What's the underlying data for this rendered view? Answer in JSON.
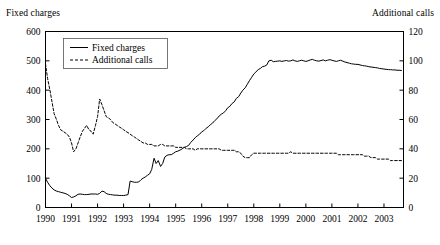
{
  "figure": {
    "left_axis_title": "Fixed charges",
    "right_axis_title": "Additional calls"
  },
  "legend": {
    "items": [
      {
        "label": "Fixed charges",
        "style": "solid"
      },
      {
        "label": "Additional calls",
        "style": "dashed"
      }
    ]
  },
  "chart_data": {
    "type": "line",
    "title": "",
    "xlabel": "",
    "ylabel": "Fixed charges",
    "y2label": "Additional calls",
    "grid": false,
    "legend_position": "top-left-inside",
    "xlim": [
      1990.0,
      2003.75
    ],
    "ylim": [
      0,
      600
    ],
    "y2lim": [
      0,
      120
    ],
    "xticks": [
      "1990",
      "1991",
      "1992",
      "1993",
      "1994",
      "1995",
      "1996",
      "1997",
      "1998",
      "1999",
      "2000",
      "2001",
      "2002",
      "2003"
    ],
    "yticks": [
      "0",
      "100",
      "200",
      "300",
      "400",
      "500",
      "600"
    ],
    "y2ticks": [
      "0",
      "20",
      "40",
      "60",
      "80",
      "100",
      "120"
    ],
    "series": [
      {
        "name": "Fixed charges",
        "axis": "left",
        "style": "solid",
        "color": "#000000",
        "x": [
          1990.0,
          1990.08,
          1990.17,
          1990.25,
          1990.33,
          1990.42,
          1990.5,
          1990.58,
          1990.67,
          1990.75,
          1990.83,
          1990.92,
          1991.0,
          1991.08,
          1991.17,
          1991.25,
          1991.33,
          1991.42,
          1991.5,
          1991.58,
          1991.67,
          1991.75,
          1991.83,
          1991.92,
          1992.0,
          1992.08,
          1992.17,
          1992.25,
          1992.33,
          1992.42,
          1992.5,
          1992.58,
          1992.67,
          1992.75,
          1992.83,
          1992.92,
          1993.0,
          1993.08,
          1993.17,
          1993.25,
          1993.33,
          1993.42,
          1993.5,
          1993.58,
          1993.67,
          1993.75,
          1993.83,
          1993.92,
          1994.0,
          1994.08,
          1994.17,
          1994.25,
          1994.33,
          1994.42,
          1994.5,
          1994.58,
          1994.67,
          1994.75,
          1994.83,
          1994.92,
          1995.0,
          1995.08,
          1995.17,
          1995.25,
          1995.33,
          1995.42,
          1995.5,
          1995.58,
          1995.67,
          1995.75,
          1995.83,
          1995.92,
          1996.0,
          1996.08,
          1996.17,
          1996.25,
          1996.33,
          1996.42,
          1996.5,
          1996.58,
          1996.67,
          1996.75,
          1996.83,
          1996.92,
          1997.0,
          1997.08,
          1997.17,
          1997.25,
          1997.33,
          1997.42,
          1997.5,
          1997.58,
          1997.67,
          1997.75,
          1997.83,
          1997.92,
          1998.0,
          1998.08,
          1998.17,
          1998.25,
          1998.33,
          1998.42,
          1998.5,
          1998.58,
          1998.67,
          1998.75,
          1998.83,
          1998.92,
          1999.0,
          1999.08,
          1999.17,
          1999.25,
          1999.33,
          1999.42,
          1999.5,
          1999.58,
          1999.67,
          1999.75,
          1999.83,
          1999.92,
          2000.0,
          2000.08,
          2000.17,
          2000.25,
          2000.33,
          2000.42,
          2000.5,
          2000.58,
          2000.67,
          2000.75,
          2000.83,
          2000.92,
          2001.0,
          2001.08,
          2001.17,
          2001.25,
          2001.33,
          2001.42,
          2001.5,
          2001.58,
          2001.67,
          2001.75,
          2001.83,
          2001.92,
          2002.0,
          2002.08,
          2002.17,
          2002.25,
          2002.33,
          2002.42,
          2002.5,
          2002.58,
          2002.67,
          2002.75,
          2002.83,
          2002.92,
          2003.0,
          2003.08,
          2003.17,
          2003.25,
          2003.33,
          2003.42,
          2003.5,
          2003.58,
          2003.67
        ],
        "values": [
          100,
          86,
          74,
          66,
          60,
          56,
          54,
          52,
          50,
          48,
          45,
          40,
          34,
          36,
          40,
          45,
          46,
          45,
          44,
          44,
          45,
          46,
          46,
          46,
          45,
          48,
          56,
          54,
          48,
          45,
          44,
          43,
          42,
          42,
          41,
          41,
          41,
          42,
          44,
          90,
          88,
          86,
          86,
          87,
          95,
          100,
          104,
          110,
          115,
          130,
          168,
          150,
          160,
          140,
          150,
          172,
          178,
          180,
          180,
          185,
          190,
          192,
          196,
          200,
          205,
          208,
          212,
          222,
          230,
          238,
          244,
          250,
          258,
          262,
          270,
          275,
          282,
          288,
          296,
          302,
          312,
          318,
          322,
          330,
          340,
          345,
          355,
          360,
          372,
          378,
          390,
          400,
          408,
          420,
          432,
          444,
          455,
          462,
          470,
          474,
          480,
          482,
          486,
          500,
          502,
          497,
          498,
          499,
          500,
          498,
          500,
          501,
          499,
          500,
          503,
          500,
          498,
          500,
          502,
          500,
          498,
          500,
          503,
          505,
          502,
          500,
          499,
          501,
          503,
          500,
          502,
          504,
          502,
          500,
          498,
          500,
          502,
          499,
          496,
          494,
          492,
          490,
          489,
          488,
          488,
          486,
          484,
          483,
          482,
          480,
          479,
          478,
          477,
          476,
          474,
          473,
          472,
          471,
          470,
          470,
          469,
          469,
          468,
          468,
          467
        ]
      },
      {
        "name": "Additional calls",
        "axis": "right",
        "style": "dashed",
        "color": "#000000",
        "x": [
          1990.0,
          1990.08,
          1990.17,
          1990.25,
          1990.33,
          1990.42,
          1990.5,
          1990.58,
          1990.67,
          1990.75,
          1990.83,
          1990.92,
          1991.0,
          1991.08,
          1991.17,
          1991.25,
          1991.33,
          1991.42,
          1991.5,
          1991.58,
          1991.67,
          1991.75,
          1991.83,
          1991.92,
          1992.0,
          1992.08,
          1992.17,
          1992.25,
          1992.33,
          1992.42,
          1992.5,
          1992.58,
          1992.67,
          1992.75,
          1992.83,
          1992.92,
          1993.0,
          1993.08,
          1993.17,
          1993.25,
          1993.33,
          1993.42,
          1993.5,
          1993.58,
          1993.67,
          1993.75,
          1993.83,
          1993.92,
          1994.0,
          1994.08,
          1994.17,
          1994.25,
          1994.33,
          1994.42,
          1994.5,
          1994.58,
          1994.67,
          1994.75,
          1994.83,
          1994.92,
          1995.0,
          1995.08,
          1995.17,
          1995.25,
          1995.33,
          1995.42,
          1995.5,
          1995.58,
          1995.67,
          1995.75,
          1995.83,
          1995.92,
          1996.0,
          1996.08,
          1996.17,
          1996.25,
          1996.33,
          1996.42,
          1996.5,
          1996.58,
          1996.67,
          1996.75,
          1996.83,
          1996.92,
          1997.0,
          1997.08,
          1997.17,
          1997.25,
          1997.33,
          1997.42,
          1997.5,
          1997.58,
          1997.67,
          1997.75,
          1997.83,
          1997.92,
          1998.0,
          1998.08,
          1998.17,
          1998.25,
          1998.33,
          1998.42,
          1998.5,
          1998.58,
          1998.67,
          1998.75,
          1998.83,
          1998.92,
          1999.0,
          1999.08,
          1999.17,
          1999.25,
          1999.33,
          1999.42,
          1999.5,
          1999.58,
          1999.67,
          1999.75,
          1999.83,
          1999.92,
          2000.0,
          2000.08,
          2000.17,
          2000.25,
          2000.33,
          2000.42,
          2000.5,
          2000.58,
          2000.67,
          2000.75,
          2000.83,
          2000.92,
          2001.0,
          2001.08,
          2001.17,
          2001.25,
          2001.33,
          2001.42,
          2001.5,
          2001.58,
          2001.67,
          2001.75,
          2001.83,
          2001.92,
          2002.0,
          2002.08,
          2002.17,
          2002.25,
          2002.33,
          2002.42,
          2002.5,
          2002.58,
          2002.67,
          2002.75,
          2002.83,
          2002.92,
          2003.0,
          2003.08,
          2003.17,
          2003.25,
          2003.33,
          2003.42,
          2003.5,
          2003.58,
          2003.67
        ],
        "values": [
          98,
          88,
          80,
          72,
          64,
          60,
          56,
          53,
          52,
          51,
          50,
          48,
          44,
          38,
          40,
          44,
          48,
          52,
          54,
          56,
          53,
          52,
          50,
          56,
          62,
          74,
          70,
          66,
          62,
          61,
          60,
          58,
          57,
          56,
          55,
          54,
          53,
          52,
          51,
          50,
          49,
          48,
          47,
          46,
          45,
          44,
          44,
          43,
          43,
          43,
          42,
          42,
          42,
          43,
          43,
          42,
          42,
          42,
          42,
          42,
          41,
          41,
          41,
          41,
          41,
          40,
          40,
          40,
          40,
          39,
          40,
          40,
          40,
          40,
          40,
          40,
          40,
          40,
          40,
          40,
          40,
          39,
          39,
          39,
          39,
          39,
          39,
          39,
          38,
          38,
          37,
          35,
          34,
          34,
          34,
          36,
          37,
          37,
          37,
          37,
          37,
          37,
          37,
          37,
          37,
          37,
          37,
          37,
          37,
          37,
          37,
          37,
          37,
          38,
          37,
          37,
          37,
          37,
          37,
          37,
          37,
          37,
          37,
          37,
          37,
          37,
          37,
          37,
          37,
          37,
          37,
          37,
          37,
          37,
          37,
          36,
          36,
          36,
          36,
          36,
          36,
          36,
          36,
          36,
          36,
          36,
          36,
          35,
          35,
          35,
          34,
          34,
          34,
          33,
          33,
          33,
          33,
          33,
          33,
          32,
          32,
          32,
          32,
          32,
          32
        ]
      }
    ]
  }
}
